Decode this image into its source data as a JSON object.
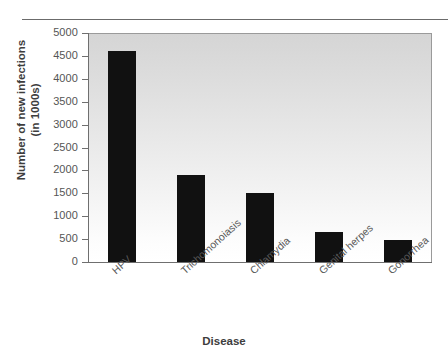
{
  "chart_data": {
    "type": "bar",
    "title": "",
    "xlabel": "Disease",
    "ylabel_line1": "Number of new infections",
    "ylabel_line2": "(in 1000s)",
    "categories": [
      "HPV",
      "Trichomonoiasis",
      "Chlamydia",
      "Genital herpes",
      "Gonorrhea"
    ],
    "values": [
      4600,
      1900,
      1500,
      650,
      470
    ],
    "ylim": [
      0,
      5000
    ],
    "yticks": [
      0,
      500,
      1000,
      1500,
      2000,
      2500,
      3000,
      3500,
      4000,
      4500,
      5000
    ],
    "ytick_labels": [
      "0",
      "500",
      "1000",
      "1500",
      "2000",
      "2500",
      "3000",
      "3500",
      "4000",
      "4500",
      "5000"
    ],
    "grid": false,
    "legend": null,
    "bar_color": "#111111",
    "plot_background": "#e6e6e6",
    "axis_color": "#6f6f6f"
  }
}
